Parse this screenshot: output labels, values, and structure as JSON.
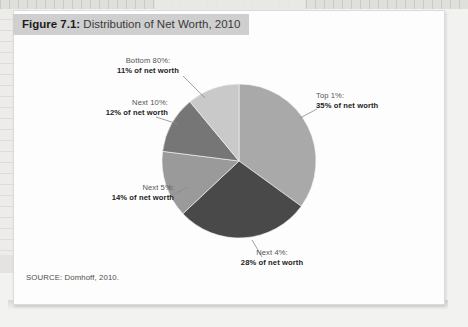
{
  "figure": {
    "number_label": "Figure 7.1:",
    "title": "Distribution of Net Worth, 2010",
    "source": "SOURCE: Domhoff, 2010."
  },
  "chart_data": {
    "type": "pie",
    "title": "Distribution of Net Worth, 2010",
    "unit": "percent of net worth",
    "legend_position": "callout-labels",
    "total": 100,
    "start_angle_deg": 0,
    "direction": "clockwise",
    "categories": [
      "Top 1%",
      "Next 4%",
      "Next 5%",
      "Next 10%",
      "Bottom 80%"
    ],
    "values": [
      35,
      28,
      14,
      12,
      11
    ],
    "colors": [
      "#a9a9a9",
      "#494949",
      "#9a9a9a",
      "#767676",
      "#c9c9c9"
    ],
    "slices": [
      {
        "id": "top1",
        "category": "Top 1%",
        "category_label": "Top 1%:",
        "value": 35,
        "value_label": "35% of net worth",
        "color": "#a9a9a9"
      },
      {
        "id": "next4",
        "category": "Next 4%",
        "category_label": "Next 4%:",
        "value": 28,
        "value_label": "28% of net worth",
        "color": "#494949"
      },
      {
        "id": "next5",
        "category": "Next 5%",
        "category_label": "Next 5%:",
        "value": 14,
        "value_label": "14% of net worth",
        "color": "#9a9a9a"
      },
      {
        "id": "next10",
        "category": "Next 10%",
        "category_label": "Next 10%:",
        "value": 12,
        "value_label": "12% of net worth",
        "color": "#767676"
      },
      {
        "id": "bottom80",
        "category": "Bottom 80%",
        "category_label": "Bottom 80%:",
        "value": 11,
        "value_label": "11% of net worth",
        "color": "#c9c9c9"
      }
    ]
  }
}
